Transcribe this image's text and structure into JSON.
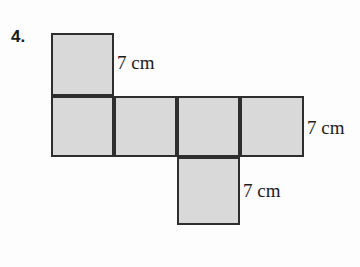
{
  "figure": {
    "problem_number": "4.",
    "colors": {
      "square_fill": "#d9d9d9",
      "square_stroke": "#2e2e2e",
      "background": "#fdfdfd",
      "text": "#1c1c1c"
    },
    "squares": [
      {
        "name": "top-square",
        "x": 51,
        "y": 33,
        "w": 63,
        "h": 63
      },
      {
        "name": "row-square-1",
        "x": 51,
        "y": 96,
        "w": 63,
        "h": 61
      },
      {
        "name": "row-square-2",
        "x": 114,
        "y": 96,
        "w": 63,
        "h": 61
      },
      {
        "name": "row-square-3",
        "x": 177,
        "y": 96,
        "w": 63,
        "h": 61
      },
      {
        "name": "row-square-4",
        "x": 240,
        "y": 96,
        "w": 64,
        "h": 61
      },
      {
        "name": "bottom-square",
        "x": 177,
        "y": 157,
        "w": 63,
        "h": 68
      }
    ],
    "labels": {
      "top": "7 cm",
      "right": "7 cm",
      "bottom": "7 cm"
    }
  }
}
